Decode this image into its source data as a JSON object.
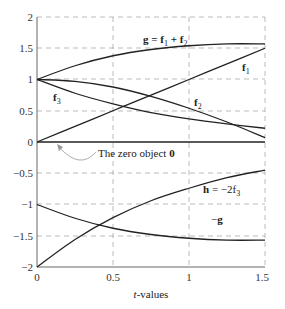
{
  "chart_data": {
    "type": "line",
    "title": "",
    "xlabel": "t-values",
    "ylabel": "",
    "xlim": [
      0,
      1.5
    ],
    "ylim": [
      -2,
      2
    ],
    "grid": true,
    "x_ticks": [
      "0",
      "0.5",
      "1",
      "1.5"
    ],
    "y_ticks": [
      "2",
      "1.5",
      "1",
      "0.5",
      "0",
      "−0.5",
      "−1",
      "−1.5",
      "−2"
    ],
    "x": [
      0,
      0.25,
      0.5,
      0.75,
      1.0,
      1.25,
      1.5
    ],
    "series": [
      {
        "name": "f1",
        "values": [
          0,
          0.25,
          0.5,
          0.75,
          1.0,
          1.25,
          1.5
        ]
      },
      {
        "name": "f2",
        "values": [
          1,
          0.97,
          0.88,
          0.73,
          0.54,
          0.32,
          0.07
        ]
      },
      {
        "name": "f3",
        "values": [
          1,
          0.78,
          0.61,
          0.47,
          0.37,
          0.29,
          0.22
        ]
      },
      {
        "name": "g = f1 + f2",
        "values": [
          1,
          1.22,
          1.38,
          1.48,
          1.54,
          1.57,
          1.57
        ]
      },
      {
        "name": "h = −2f3",
        "values": [
          -2,
          -1.56,
          -1.21,
          -0.94,
          -0.74,
          -0.57,
          -0.45
        ]
      },
      {
        "name": "−g",
        "values": [
          -1,
          -1.22,
          -1.38,
          -1.48,
          -1.54,
          -1.57,
          -1.57
        ]
      },
      {
        "name": "zero object 0",
        "values": [
          0,
          0,
          0,
          0,
          0,
          0,
          0
        ]
      }
    ],
    "annotations": [
      {
        "text": "g = f1 + f2",
        "x": 0.7,
        "y": 1.65
      },
      {
        "text": "f1",
        "x": 1.37,
        "y": 1.2
      },
      {
        "text": "f2",
        "x": 1.04,
        "y": 0.62
      },
      {
        "text": "f3",
        "x": 0.11,
        "y": 0.7
      },
      {
        "text": "The zero object 0",
        "x": 0.4,
        "y": -0.2
      },
      {
        "text": "h = −2f3",
        "x": 1.1,
        "y": -0.75
      },
      {
        "text": "−g",
        "x": 1.16,
        "y": -1.25
      }
    ]
  },
  "labels": {
    "g": "g = f",
    "g_sub1": "1",
    "g_plus": " + f",
    "g_sub2": "2",
    "f1": "f",
    "f1_sub": "1",
    "f2": "f",
    "f2_sub": "2",
    "f3": "f",
    "f3_sub": "3",
    "zero_text": "The zero object ",
    "zero_sym": "0",
    "h": "h",
    "h_rest": " = −2f",
    "h_sub": "3",
    "neg_g_minus": "−",
    "neg_g": "g",
    "xlabel_t": "t",
    "xlabel_rest": "-values"
  },
  "ticks": {
    "y": [
      "2",
      "1.5",
      "1",
      "0.5",
      "0",
      "−0.5",
      "−1",
      "−1.5",
      "−2"
    ],
    "x": [
      "0",
      "0.5",
      "1",
      "1.5"
    ]
  }
}
